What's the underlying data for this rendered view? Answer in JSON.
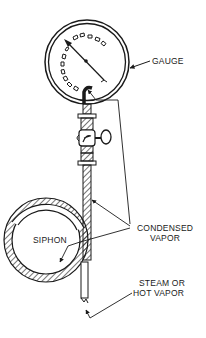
{
  "diagram": {
    "type": "technical-illustration",
    "labels": {
      "gauge": "GAUGE",
      "siphon": "SIPHON",
      "condensed_vapor_line1": "CONDENSED",
      "condensed_vapor_line2": "VAPOR",
      "steam_line1": "STEAM OR",
      "steam_line2": "HOT VAPOR"
    },
    "components": [
      "gauge-dial",
      "gauge-needle",
      "shutoff-valve",
      "valve-handle",
      "siphon-loop",
      "inlet-pipe"
    ],
    "colors": {
      "line": "#1a1a1a",
      "background": "#ffffff"
    }
  }
}
